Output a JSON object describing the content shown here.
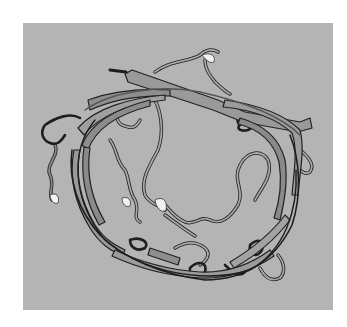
{
  "image": {
    "subject": "protein backbone ribbon structure",
    "style": "grayscale cartoon rendering with beta-strand arrows and coil loops",
    "background_color": "#b4b4b4",
    "page_color": "#ffffff"
  },
  "colors": {
    "coil_dark": "#1e1e1e",
    "coil_mid": "#555555",
    "coil_light": "#8a8a8a",
    "strand_fill": "#9a9a9a",
    "helix_highlight": "#f2f2f2"
  }
}
